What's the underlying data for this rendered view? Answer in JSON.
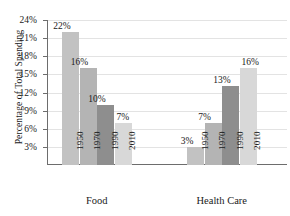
{
  "chart_data": {
    "type": "bar",
    "title": "",
    "xlabel": "",
    "ylabel": "Percentage of Total Spending",
    "ylim": [
      0,
      24
    ],
    "ytick_labels": [
      "3%",
      "6%",
      "9%",
      "12%",
      "15%",
      "18%",
      "21%",
      "24%"
    ],
    "ytick_values": [
      3,
      6,
      9,
      12,
      15,
      18,
      21,
      24
    ],
    "grid": true,
    "legend": "none",
    "categories": [
      "1950",
      "1970",
      "1990",
      "2010"
    ],
    "groups": [
      {
        "name": "Food",
        "bars": [
          {
            "category": "1950",
            "value": 22,
            "label": "22%",
            "color": "#c2c2c2"
          },
          {
            "category": "1970",
            "value": 16,
            "label": "16%",
            "color": "#b4b4b4"
          },
          {
            "category": "1990",
            "value": 10,
            "label": "10%",
            "color": "#8e8e8e"
          },
          {
            "category": "2010",
            "value": 7,
            "label": "7%",
            "color": "#d8d8d8"
          }
        ]
      },
      {
        "name": "Health Care",
        "bars": [
          {
            "category": "1950",
            "value": 3,
            "label": "3%",
            "color": "#c2c2c2"
          },
          {
            "category": "1970",
            "value": 7,
            "label": "7%",
            "color": "#b4b4b4"
          },
          {
            "category": "1990",
            "value": 13,
            "label": "13%",
            "color": "#8e8e8e"
          },
          {
            "category": "2010",
            "value": 16,
            "label": "16%",
            "color": "#d8d8d8"
          }
        ]
      }
    ]
  }
}
